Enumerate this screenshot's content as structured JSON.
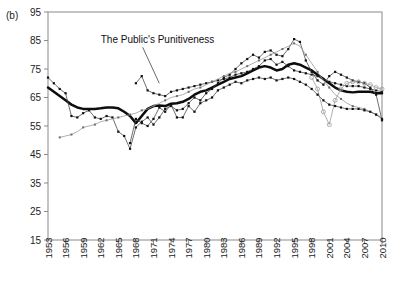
{
  "panel": {
    "label": "(b)"
  },
  "annotation": {
    "text": "The Public's Punitiveness"
  },
  "colors": {
    "main_line": "#0d0d0d",
    "thin_line": "#4a4a4a",
    "light_line": "#9a9a9a",
    "axis": "#8a8a8a",
    "background": "#ffffff"
  },
  "chart_data": {
    "type": "line",
    "title": "",
    "subtitle": "",
    "xlabel": "",
    "ylabel": "",
    "xlim": [
      1953,
      2010
    ],
    "ylim": [
      15,
      95
    ],
    "grid": false,
    "legend_position": "none",
    "annotations": [
      {
        "text": "The Public's Punitiveness",
        "x": 1962,
        "y": 84,
        "points_to_x": 1972,
        "points_to_y": 70
      }
    ],
    "ytick_labels": [
      15,
      25,
      35,
      45,
      55,
      65,
      75,
      85,
      95
    ],
    "xtick_labels": [
      1953,
      1956,
      1959,
      1962,
      1965,
      1968,
      1971,
      1974,
      1977,
      1980,
      1983,
      1986,
      1989,
      1992,
      1995,
      1998,
      2001,
      2004,
      2007,
      2010
    ],
    "x": [
      1953,
      1954,
      1955,
      1956,
      1957,
      1958,
      1959,
      1960,
      1961,
      1962,
      1963,
      1964,
      1965,
      1966,
      1967,
      1968,
      1969,
      1970,
      1971,
      1972,
      1973,
      1974,
      1975,
      1976,
      1977,
      1978,
      1979,
      1980,
      1981,
      1982,
      1983,
      1984,
      1985,
      1986,
      1987,
      1988,
      1989,
      1990,
      1991,
      1992,
      1993,
      1994,
      1995,
      1996,
      1997,
      1998,
      1999,
      2000,
      2001,
      2002,
      2003,
      2004,
      2005,
      2006,
      2007,
      2008,
      2009,
      2010
    ],
    "series": [
      {
        "name": "The Public's Punitiveness (index)",
        "style": "thick-black",
        "marker": "none",
        "values": [
          68.5,
          67.0,
          65.5,
          64.0,
          62.5,
          61.5,
          61.0,
          61.0,
          61.0,
          61.2,
          61.5,
          61.5,
          61.2,
          60.0,
          58.5,
          56.0,
          58.5,
          61.0,
          62.0,
          62.2,
          62.0,
          62.8,
          63.0,
          63.5,
          64.5,
          66.0,
          67.0,
          67.5,
          68.5,
          69.5,
          70.5,
          71.5,
          72.0,
          72.5,
          73.5,
          74.5,
          75.5,
          76.0,
          75.5,
          74.5,
          75.0,
          76.5,
          77.0,
          76.5,
          75.5,
          74.5,
          73.0,
          71.5,
          70.0,
          68.5,
          67.5,
          67.0,
          66.8,
          67.0,
          67.0,
          67.0,
          66.5,
          66.5
        ]
      },
      {
        "name": "Component A (filled squares, dark)",
        "style": "thin-dark",
        "marker": "square",
        "values": [
          72.0,
          70.0,
          68.0,
          66.5,
          58.5,
          58.0,
          59.5,
          60.5,
          58.0,
          57.5,
          58.5,
          58.0,
          53.0,
          51.5,
          47.0,
          54.5,
          56.5,
          58.0,
          55.5,
          58.0,
          61.0,
          62.0,
          60.5,
          61.0,
          63.0,
          65.0,
          64.0,
          66.5,
          68.0,
          70.0,
          72.0,
          73.0,
          75.0,
          77.0,
          78.5,
          80.0,
          79.0,
          81.0,
          81.5,
          80.0,
          79.5,
          82.0,
          85.5,
          84.5,
          78.0,
          74.0,
          71.0,
          69.5,
          72.5,
          74.0,
          73.0,
          72.0,
          71.0,
          70.5,
          70.0,
          68.5,
          66.0,
          57.0
        ]
      },
      {
        "name": "Component B (filled squares, mid)",
        "style": "thin-dark",
        "marker": "square",
        "values": [
          null,
          null,
          null,
          null,
          null,
          null,
          null,
          null,
          null,
          null,
          null,
          null,
          null,
          null,
          null,
          70.0,
          72.5,
          67.5,
          66.5,
          66.0,
          65.5,
          67.0,
          67.5,
          68.0,
          68.5,
          69.0,
          69.5,
          70.0,
          70.5,
          71.0,
          71.5,
          72.0,
          73.0,
          73.5,
          74.0,
          75.0,
          76.0,
          78.0,
          78.5,
          76.5,
          77.5,
          76.0,
          74.5,
          74.0,
          73.5,
          73.0,
          72.5,
          71.5,
          70.5,
          70.0,
          69.5,
          69.0,
          69.0,
          69.0,
          68.5,
          68.0,
          67.5,
          67.0
        ]
      },
      {
        "name": "Component C (light, open circles)",
        "style": "light",
        "marker": "circle",
        "values": [
          null,
          null,
          null,
          null,
          null,
          null,
          null,
          null,
          null,
          null,
          null,
          null,
          null,
          null,
          null,
          null,
          null,
          null,
          null,
          null,
          null,
          null,
          null,
          null,
          null,
          null,
          null,
          null,
          null,
          null,
          null,
          null,
          null,
          null,
          null,
          null,
          null,
          null,
          null,
          null,
          null,
          null,
          null,
          null,
          null,
          72.0,
          68.0,
          60.0,
          55.5,
          64.0,
          68.0,
          70.0,
          70.5,
          70.5,
          70.0,
          69.5,
          68.5,
          68.0
        ]
      },
      {
        "name": "Component D (rising trend line)",
        "style": "light",
        "marker": "square",
        "values": [
          null,
          null,
          51.0,
          51.5,
          52.0,
          53.0,
          54.5,
          55.0,
          55.5,
          56.5,
          57.0,
          57.5,
          58.0,
          58.5,
          59.0,
          59.5,
          60.5,
          61.0,
          62.0,
          63.0,
          64.0,
          65.0,
          65.5,
          66.0,
          67.0,
          68.0,
          68.5,
          69.5,
          70.5,
          71.5,
          72.5,
          73.5,
          74.0,
          75.0,
          76.0,
          77.0,
          78.0,
          79.0,
          80.0,
          81.0,
          82.0,
          83.0,
          84.0,
          83.0,
          80.0,
          77.0,
          74.0,
          71.0,
          68.5,
          66.0,
          64.5,
          63.0,
          62.0,
          61.5,
          61.0,
          60.0,
          59.0,
          58.0
        ]
      },
      {
        "name": "Component E (filled squares, low branch)",
        "style": "thin-dark",
        "marker": "square",
        "values": [
          null,
          null,
          null,
          null,
          null,
          null,
          null,
          null,
          null,
          null,
          null,
          null,
          null,
          null,
          49.0,
          57.5,
          56.0,
          55.0,
          57.5,
          61.5,
          60.0,
          62.5,
          58.0,
          58.0,
          62.0,
          60.0,
          63.0,
          64.0,
          65.0,
          67.5,
          68.5,
          69.5,
          70.5,
          70.0,
          71.0,
          71.5,
          72.0,
          71.5,
          72.0,
          71.0,
          71.5,
          72.0,
          71.5,
          70.5,
          69.5,
          68.0,
          66.0,
          64.0,
          62.5,
          62.0,
          61.5,
          61.0,
          61.0,
          61.0,
          60.5,
          60.0,
          59.0,
          57.5
        ]
      }
    ]
  }
}
